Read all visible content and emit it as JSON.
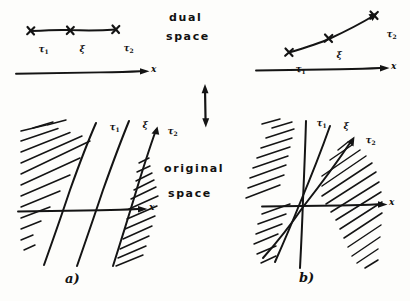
{
  "figure": {
    "background_color": "#fdfdfb",
    "ink_color": "#141414",
    "width": 410,
    "height": 301
  },
  "center_labels": {
    "dual_line1": "dual",
    "dual_line2": "space",
    "original_line1": "original",
    "original_line2": "space",
    "connector_icon": "double-headed-vertical-arrow"
  },
  "axis": {
    "label": "x",
    "arrow_icon": "arrow-right-icon"
  },
  "point_labels": {
    "tau1": {
      "base": "τ",
      "sub": "1"
    },
    "xi": {
      "base": "ξ",
      "sub": ""
    },
    "tau2": {
      "base": "τ",
      "sub": "2"
    }
  },
  "panels": [
    {
      "id": "dual-left",
      "region": "dual",
      "side": "a",
      "caption": "",
      "description": "horizontal segment with three cross marks on a line above the x axis",
      "marks": [
        "tau1",
        "xi",
        "tau2"
      ],
      "segment": {
        "orientation": "horizontal"
      }
    },
    {
      "id": "dual-right",
      "region": "dual",
      "side": "b",
      "caption": "",
      "description": "slanted segment rising to the right with three cross marks above the x axis",
      "marks": [
        "tau1",
        "xi",
        "tau2"
      ],
      "segment": {
        "orientation": "slanted-up-right"
      }
    },
    {
      "id": "original-left",
      "region": "original",
      "side": "a",
      "caption": "a)",
      "description": "three nearly parallel steep lines crossing the x axis, hatched half planes on the outer sides",
      "lines": [
        "tau1",
        "xi",
        "tau2"
      ],
      "line_arrangement": "parallel"
    },
    {
      "id": "original-right",
      "region": "original",
      "side": "b",
      "caption": "b)",
      "description": "three concurrent lines through a common point, hatched wedge regions",
      "lines": [
        "tau1",
        "xi",
        "tau2"
      ],
      "line_arrangement": "concurrent"
    }
  ]
}
